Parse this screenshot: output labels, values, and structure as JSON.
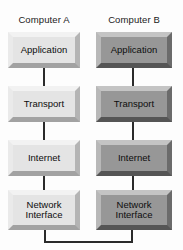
{
  "diagram": {
    "background_color": "#fdfdfd",
    "line_color": "#2b2b2b",
    "columns": [
      {
        "id": "computer-a",
        "heading": "Computer A",
        "style": "light",
        "fill_color": "#e4e4e4",
        "layers": [
          {
            "label": "Application"
          },
          {
            "label": "Transport"
          },
          {
            "label": "Internet"
          },
          {
            "label": "Network\nInterface",
            "line1": "Network",
            "line2": "Interface"
          }
        ]
      },
      {
        "id": "computer-b",
        "heading": "Computer B",
        "style": "dark",
        "fill_color": "#979797",
        "layers": [
          {
            "label": "Application"
          },
          {
            "label": "Transport"
          },
          {
            "label": "Internet"
          },
          {
            "label": "Network\nInterface",
            "line1": "Network",
            "line2": "Interface"
          }
        ]
      }
    ],
    "connectors": {
      "vertical_label": "stack-link",
      "physical_link_label": "physical-network-link"
    }
  }
}
